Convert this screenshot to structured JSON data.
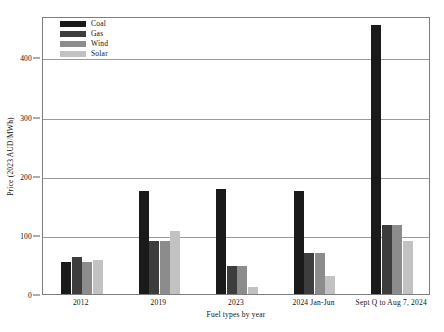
{
  "chart_data": {
    "type": "bar",
    "title": "",
    "subtitle": "",
    "xlabel": "Fuel types by year",
    "ylabel": "Price (2023 AUD/MWh)",
    "categories": [
      "2012",
      "2019",
      "2023",
      "2024 Jan-Jun",
      "Sept Q to Aug 7, 2024"
    ],
    "series": [
      {
        "name": "Coal",
        "color": "#1a1a1a",
        "values": [
          54,
          175,
          178,
          175,
          455
        ]
      },
      {
        "name": "Gas",
        "color": "#3d3d3d",
        "values": [
          62,
          90,
          48,
          70,
          116
        ]
      },
      {
        "name": "Wind",
        "color": "#8c8c8c",
        "values": [
          54,
          90,
          48,
          70,
          116
        ]
      },
      {
        "name": "Solar",
        "color": "#c2c2c2",
        "values": [
          57,
          107,
          12,
          31,
          90
        ]
      }
    ],
    "ylim": [
      0,
      470
    ],
    "yticks": [
      0,
      100,
      200,
      300,
      400
    ],
    "ytick_labels": [
      "0",
      "100",
      "200",
      "300",
      "400"
    ],
    "grid": true,
    "legend_position": "upper-left",
    "annotations": []
  }
}
